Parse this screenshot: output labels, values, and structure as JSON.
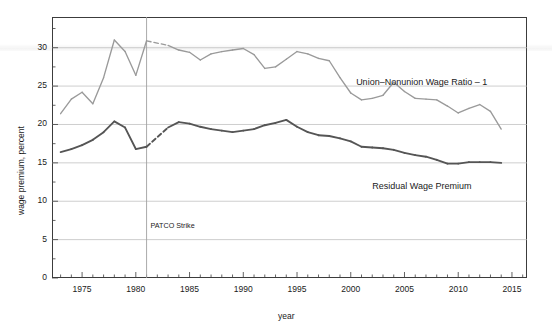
{
  "chart_data": {
    "type": "line",
    "title": "",
    "xlabel": "year",
    "ylabel": "wage premium, percent",
    "xlim": [
      1972.2,
      2016.4
    ],
    "ylim": [
      0,
      34
    ],
    "xticks": [
      1975,
      1980,
      1985,
      1990,
      1995,
      2000,
      2005,
      2010,
      2015
    ],
    "yticks": [
      0,
      5,
      10,
      15,
      20,
      25,
      30
    ],
    "xtick_labels": [
      "1975",
      "1980",
      "1985",
      "1990",
      "1995",
      "2000",
      "2005",
      "2010",
      "2015"
    ],
    "ytick_labels": [
      "0",
      "5",
      "10",
      "15",
      "20",
      "25",
      "30"
    ],
    "grid": true,
    "legend": "inline-labels",
    "annotations": [
      {
        "text": "PATCO Strike",
        "x": 1981,
        "y": 6.8,
        "type": "vline-label"
      }
    ],
    "vlines": [
      {
        "x": 1981,
        "label": "PATCO Strike"
      }
    ],
    "series": [
      {
        "name": "Union–Nonunion Wage Ratio – 1",
        "color": "#9a9a9a",
        "label_x": 2000.5,
        "label_y": 25.4,
        "x": [
          1973,
          1974,
          1975,
          1976,
          1977,
          1978,
          1979,
          1980,
          1981,
          1983,
          1984,
          1985,
          1986,
          1987,
          1988,
          1989,
          1990,
          1991,
          1992,
          1993,
          1994,
          1995,
          1996,
          1997,
          1998,
          1999,
          2000,
          2001,
          2002,
          2003,
          2004,
          2005,
          2006,
          2007,
          2008,
          2009,
          2010,
          2011,
          2012,
          2013,
          2014
        ],
        "y": [
          21.4,
          23.3,
          24.2,
          22.7,
          26.1,
          31.0,
          29.5,
          26.4,
          30.9,
          30.3,
          29.7,
          29.4,
          28.4,
          29.2,
          29.5,
          29.7,
          29.9,
          29.1,
          27.3,
          27.5,
          28.5,
          29.5,
          29.2,
          28.6,
          28.3,
          26.1,
          24.1,
          23.2,
          23.4,
          23.8,
          25.5,
          24.3,
          23.4,
          23.3,
          23.2,
          22.4,
          21.5,
          22.1,
          22.6,
          21.7,
          19.4
        ],
        "dashed_segments": [
          [
            1981,
            1983
          ]
        ]
      },
      {
        "name": "Residual Wage Premium",
        "color": "#555555",
        "label_x": 2002.0,
        "label_y": 11.9,
        "x": [
          1973,
          1974,
          1975,
          1976,
          1977,
          1978,
          1979,
          1980,
          1981,
          1983,
          1984,
          1985,
          1986,
          1987,
          1988,
          1989,
          1990,
          1991,
          1992,
          1993,
          1994,
          1995,
          1996,
          1997,
          1998,
          1999,
          2000,
          2001,
          2002,
          2003,
          2004,
          2005,
          2006,
          2007,
          2008,
          2009,
          2010,
          2011,
          2012,
          2013,
          2014
        ],
        "y": [
          16.4,
          16.8,
          17.3,
          18.0,
          19.0,
          20.4,
          19.6,
          16.8,
          17.1,
          19.6,
          20.3,
          20.1,
          19.7,
          19.4,
          19.2,
          19.0,
          19.2,
          19.4,
          19.9,
          20.2,
          20.6,
          19.7,
          19.0,
          18.6,
          18.5,
          18.2,
          17.8,
          17.1,
          17.0,
          16.9,
          16.7,
          16.3,
          16.0,
          15.8,
          15.4,
          14.9,
          14.9,
          15.1,
          15.1,
          15.1,
          15.0
        ],
        "dashed_segments": [
          [
            1981,
            1983
          ]
        ]
      }
    ]
  },
  "axes": {
    "y_axis_label": "wage premium, percent",
    "x_axis_label": "year"
  }
}
